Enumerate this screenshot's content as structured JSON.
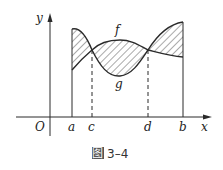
{
  "figure": {
    "caption_prefix": "图",
    "caption_number": "3–4",
    "axes": {
      "x_label": "x",
      "y_label": "y",
      "origin_label": "O"
    },
    "ticks": [
      {
        "label": "a",
        "x": 72
      },
      {
        "label": "c",
        "x": 92
      },
      {
        "label": "d",
        "x": 148
      },
      {
        "label": "b",
        "x": 183
      }
    ],
    "curves": [
      {
        "name": "f",
        "label": "f"
      },
      {
        "name": "g",
        "label": "g"
      }
    ]
  },
  "colors": {
    "stroke": "#2a2a2a",
    "caption_box": "#555555"
  }
}
